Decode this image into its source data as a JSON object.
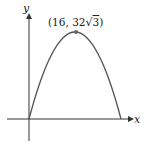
{
  "diagram": {
    "type": "parabola-graph",
    "axes": {
      "x_label": "x",
      "y_label": "y"
    },
    "curve": {
      "description": "downward-opening parabola through origin",
      "start": [
        0,
        0
      ],
      "vertex": [
        16,
        "32√3"
      ],
      "end": [
        32,
        0
      ]
    },
    "vertex_label": {
      "prefix": "(16, 32",
      "radical": "√",
      "radicand": "3",
      "suffix": ")"
    },
    "colors": {
      "curve": "#555555",
      "axes": "#333333",
      "point": "#666666"
    }
  }
}
